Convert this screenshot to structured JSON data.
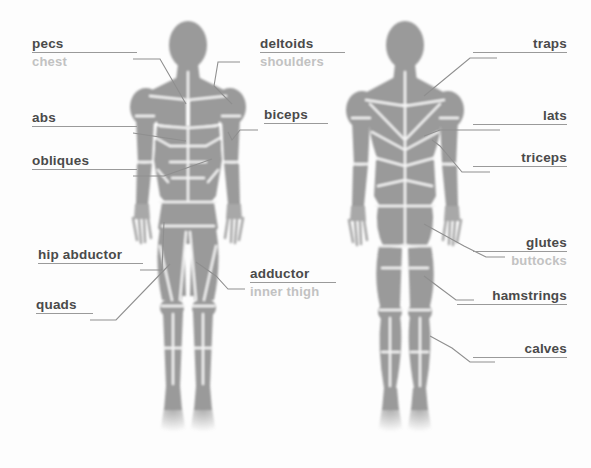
{
  "diagram": {
    "view_front": "front view",
    "view_back": "back view",
    "colors": {
      "background": "#fdfdfd",
      "muscle_fill": "#9a9a9a",
      "muscle_fill_light": "#b0b0b0",
      "separator": "#f2f2f2",
      "label_primary": "#4a4a4a",
      "label_secondary": "#c2c2c2",
      "rule": "#9a9a9a",
      "leader": "#8f8f8f"
    },
    "labels": [
      {
        "id": "pecs",
        "primary": "pecs",
        "secondary": "chest"
      },
      {
        "id": "abs",
        "primary": "abs",
        "secondary": ""
      },
      {
        "id": "obliques",
        "primary": "obliques",
        "secondary": ""
      },
      {
        "id": "hip-abductor",
        "primary": "hip abductor",
        "secondary": ""
      },
      {
        "id": "quads",
        "primary": "quads",
        "secondary": ""
      },
      {
        "id": "deltoids",
        "primary": "deltoids",
        "secondary": "shoulders"
      },
      {
        "id": "biceps",
        "primary": "biceps",
        "secondary": ""
      },
      {
        "id": "adductor",
        "primary": "adductor",
        "secondary": "inner thigh"
      },
      {
        "id": "traps",
        "primary": "traps",
        "secondary": ""
      },
      {
        "id": "lats",
        "primary": "lats",
        "secondary": ""
      },
      {
        "id": "triceps",
        "primary": "triceps",
        "secondary": ""
      },
      {
        "id": "glutes",
        "primary": "glutes",
        "secondary": "buttocks"
      },
      {
        "id": "hamstrings",
        "primary": "hamstrings",
        "secondary": ""
      },
      {
        "id": "calves",
        "primary": "calves",
        "secondary": ""
      }
    ]
  }
}
